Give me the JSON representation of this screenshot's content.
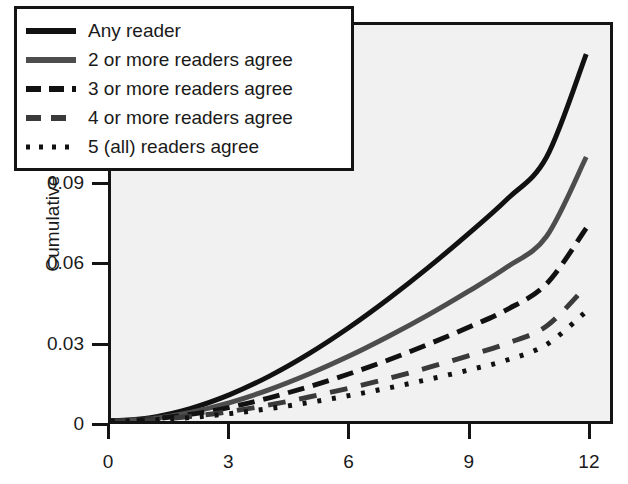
{
  "chart_data": {
    "type": "line",
    "title": "",
    "xlabel": "",
    "ylabel": "Cumulative risk",
    "xlim": [
      0,
      12.6
    ],
    "ylim": [
      0,
      0.15
    ],
    "xticks": [
      0,
      3,
      6,
      9,
      12
    ],
    "xtick_labels": [
      "0",
      "3",
      "6",
      "9",
      "12"
    ],
    "yticks": [
      0,
      0.03,
      0.06,
      0.09,
      0.12,
      0.15
    ],
    "ytick_labels": [
      "0",
      "0.03",
      "0.06",
      "0.09",
      "0.12",
      "0.15"
    ],
    "grid": false,
    "legend_position": "upper-left",
    "plot_background": "#f1f1f1",
    "axis_color": "#141414",
    "x": [
      0,
      1,
      2,
      3,
      4,
      5,
      6,
      7,
      8,
      9,
      10,
      11,
      12
    ],
    "series": [
      {
        "name": "Any reader",
        "label": "Any reader",
        "style": "solid",
        "color": "#111111",
        "width": 5,
        "values": [
          0,
          0.0013,
          0.0047,
          0.01,
          0.017,
          0.0255,
          0.0353,
          0.0462,
          0.058,
          0.0706,
          0.084,
          0.1,
          0.139
        ]
      },
      {
        "name": "2 or more readers agree",
        "label": "2 or more readers agree",
        "style": "solid",
        "color": "#4d4d4d",
        "width": 5,
        "values": [
          0,
          0.0009,
          0.0033,
          0.007,
          0.0119,
          0.0178,
          0.0245,
          0.032,
          0.0401,
          0.0489,
          0.0583,
          0.07,
          0.1
        ]
      },
      {
        "name": "3 or more readers agree",
        "label": "3 or more readers agree",
        "style": "dashed-short",
        "color": "#111111",
        "width": 5,
        "values": [
          0,
          0.0007,
          0.0025,
          0.0052,
          0.0088,
          0.013,
          0.0178,
          0.0231,
          0.029,
          0.0353,
          0.0422,
          0.052,
          0.073
        ]
      },
      {
        "name": "4 or more readers agree",
        "label": "4 or more readers agree",
        "style": "dashed-long",
        "color": "#3a3a3a",
        "width": 5,
        "values": [
          0,
          0.0005,
          0.0017,
          0.0036,
          0.0061,
          0.0091,
          0.0124,
          0.0161,
          0.0202,
          0.0246,
          0.0294,
          0.036,
          0.051
        ]
      },
      {
        "name": "5 (all) readers agree",
        "label": "5 (all) readers agree",
        "style": "dotted",
        "color": "#111111",
        "width": 5,
        "values": [
          0,
          0.0004,
          0.0013,
          0.0028,
          0.0047,
          0.007,
          0.0096,
          0.0125,
          0.0157,
          0.0192,
          0.0231,
          0.029,
          0.0415
        ]
      }
    ]
  },
  "legend": {
    "items": [
      {
        "label": "Any reader"
      },
      {
        "label": "2 or more readers agree"
      },
      {
        "label": "3 or more readers agree"
      },
      {
        "label": "4 or more readers agree"
      },
      {
        "label": "5 (all) readers agree"
      }
    ]
  },
  "axes": {
    "ylabel": "Cumulative risk"
  }
}
